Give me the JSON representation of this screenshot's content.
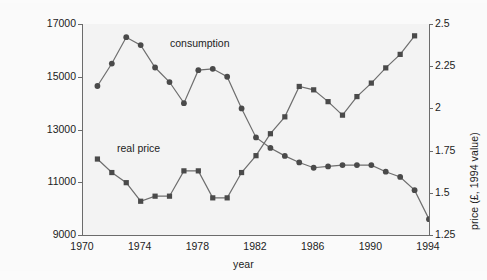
{
  "chart_data": {
    "type": "line",
    "title": "",
    "xlabel": "year",
    "ylabel": "cigarette consumption 1994 constant price (£million)",
    "ylabel_right": "price (£, 1994 value)",
    "xlim": [
      1970,
      1994
    ],
    "ylim": [
      9000,
      17000
    ],
    "ylim_right": [
      1.25,
      2.5
    ],
    "grid": false,
    "legend_position": "inline-annotations",
    "xticks": [
      "1970",
      "1974",
      "1978",
      "1982",
      "1986",
      "1990",
      "1994"
    ],
    "xtick_values": [
      1970,
      1974,
      1978,
      1982,
      1986,
      1990,
      1994
    ],
    "yticks_left": [
      "17000",
      "15000",
      "13000",
      "11000",
      "9000"
    ],
    "ytick_values_left": [
      17000,
      15000,
      13000,
      11000,
      9000
    ],
    "yticks_right": [
      "2.5",
      "2.25",
      "2",
      "1.75",
      "1.5",
      "1.25"
    ],
    "ytick_values_right": [
      2.5,
      2.25,
      2,
      1.75,
      1.5,
      1.25
    ],
    "marker_color": "#4a4a4a",
    "line_color": "#6e6e6e",
    "plot_background": "#f3f3f3",
    "series": [
      {
        "name": "consumption",
        "axis": "left",
        "marker": "circle",
        "x": [
          1971,
          1972,
          1973,
          1974,
          1975,
          1976,
          1977,
          1978,
          1979,
          1980,
          1981,
          1982,
          1983,
          1984,
          1985,
          1986,
          1987,
          1988,
          1989,
          1990,
          1991,
          1992,
          1993,
          1994
        ],
        "values": [
          14650,
          15500,
          16500,
          16200,
          15350,
          14800,
          14000,
          15250,
          15300,
          15000,
          13800,
          12700,
          12300,
          12000,
          11750,
          11550,
          11600,
          11650,
          11650,
          11650,
          11400,
          11200,
          10700,
          9600
        ]
      },
      {
        "name": "real price",
        "axis": "right",
        "marker": "square",
        "x": [
          1971,
          1972,
          1973,
          1974,
          1975,
          1976,
          1977,
          1978,
          1979,
          1980,
          1981,
          1982,
          1983,
          1984,
          1985,
          1986,
          1987,
          1988,
          1989,
          1990,
          1991,
          1992,
          1993
        ],
        "values": [
          1.7,
          1.62,
          1.56,
          1.45,
          1.48,
          1.48,
          1.63,
          1.63,
          1.47,
          1.47,
          1.62,
          1.72,
          1.85,
          1.95,
          2.13,
          2.11,
          2.04,
          1.96,
          2.07,
          2.15,
          2.24,
          2.32,
          2.43
        ]
      }
    ],
    "annotations": [
      {
        "text": "consumption",
        "series": "consumption"
      },
      {
        "text": "real price",
        "series": "real price"
      }
    ]
  }
}
